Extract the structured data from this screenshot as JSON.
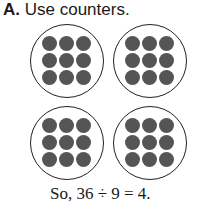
{
  "heading": {
    "label": "A.",
    "text": "Use counters."
  },
  "groups": [
    {
      "counters": 9
    },
    {
      "counters": 9
    },
    {
      "counters": 9
    },
    {
      "counters": 9
    }
  ],
  "counter_color": "#555555",
  "result": {
    "text": "So, 36 ÷ 9 = 4."
  }
}
